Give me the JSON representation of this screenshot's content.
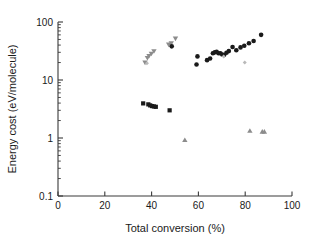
{
  "chart_data": {
    "type": "scatter",
    "title": "",
    "xlabel": "Total conversion (%)",
    "ylabel": "Energy cost (eV/molecule)",
    "xlim": [
      0,
      100
    ],
    "ylim": [
      0.1,
      100
    ],
    "yscale": "log",
    "xscale": "linear",
    "grid": false,
    "legend": "none",
    "xticks": [
      0,
      20,
      40,
      60,
      80,
      100
    ],
    "xtick_labels": [
      "0",
      "20",
      "40",
      "60",
      "80",
      "100"
    ],
    "yticks": [
      0.1,
      1,
      10,
      100
    ],
    "ytick_labels": [
      "0.1",
      "1",
      "10",
      "100"
    ],
    "yminorticks": [
      0.2,
      0.3,
      0.4,
      0.5,
      0.6,
      0.7,
      0.8,
      0.9,
      2,
      3,
      4,
      5,
      6,
      7,
      8,
      9,
      20,
      30,
      40,
      50,
      60,
      70,
      80,
      90
    ],
    "series": [
      {
        "name": "gray-down-triangles",
        "marker": "triangle-down",
        "color": "#8c8c8c",
        "size": 5.0,
        "points": [
          [
            37.2,
            20.0
          ],
          [
            38.2,
            24.0
          ],
          [
            38.9,
            26.0
          ],
          [
            39.9,
            28.5
          ],
          [
            41.0,
            31.5
          ],
          [
            47.3,
            41.0
          ],
          [
            48.4,
            43.0
          ],
          [
            50.2,
            52.0
          ]
        ]
      },
      {
        "name": "black-circles",
        "marker": "circle",
        "color": "#1a1a1a",
        "size": 4.6,
        "points": [
          [
            48.6,
            38.0
          ],
          [
            59.2,
            18.5
          ],
          [
            59.6,
            25.5
          ],
          [
            63.7,
            22.0
          ],
          [
            65.0,
            23.5
          ],
          [
            66.2,
            29.0
          ],
          [
            67.0,
            30.0
          ],
          [
            67.8,
            30.5
          ],
          [
            68.6,
            29.0
          ],
          [
            69.4,
            29.0
          ],
          [
            70.2,
            27.5
          ],
          [
            71.0,
            27.0
          ],
          [
            72.0,
            29.5
          ],
          [
            73.0,
            31.5
          ],
          [
            74.6,
            37.0
          ],
          [
            76.2,
            32.5
          ],
          [
            78.0,
            36.5
          ],
          [
            79.6,
            39.0
          ],
          [
            81.6,
            43.0
          ],
          [
            83.6,
            47.0
          ],
          [
            86.8,
            60.0
          ]
        ]
      },
      {
        "name": "black-squares",
        "marker": "square",
        "color": "#1a1a1a",
        "size": 4.2,
        "points": [
          [
            36.4,
            3.95
          ],
          [
            38.6,
            3.8
          ],
          [
            39.4,
            3.65
          ],
          [
            40.2,
            3.55
          ],
          [
            41.0,
            3.5
          ],
          [
            41.8,
            3.45
          ],
          [
            47.7,
            3.0
          ]
        ]
      },
      {
        "name": "gray-up-triangles",
        "marker": "triangle-up",
        "color": "#8c8c8c",
        "size": 5.0,
        "points": [
          [
            54.2,
            0.92
          ],
          [
            82.0,
            1.33
          ],
          [
            87.3,
            1.28
          ],
          [
            88.2,
            1.28
          ]
        ]
      },
      {
        "name": "light-gray-diamonds",
        "marker": "diamond",
        "color": "#b9b9b9",
        "size": 4.0,
        "points": [
          [
            38.0,
            19.5
          ],
          [
            70.8,
            25.5
          ],
          [
            79.8,
            20.0
          ]
        ]
      }
    ]
  },
  "figure": {
    "background": "#ffffff",
    "axis_color": "#3a3a3a",
    "text_color": "#1a1a1a"
  }
}
